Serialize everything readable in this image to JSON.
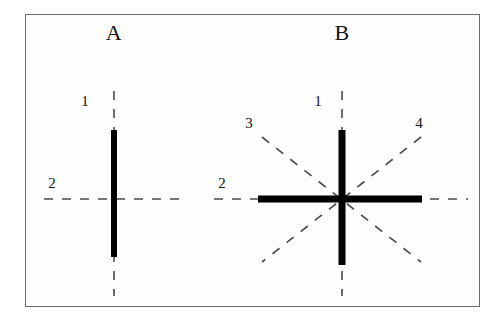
{
  "figure": {
    "background_color": "#fdfdfd",
    "border_color": "#6b6b6b",
    "stroke_color": "#000000",
    "dash_color": "#4a4a4a"
  },
  "panels": [
    {
      "title": "A",
      "title_x": 114,
      "title_y": 33,
      "center_x": 114,
      "center_y": 199,
      "labels": [
        {
          "text": "1",
          "x": 85,
          "y": 101
        },
        {
          "text": "2",
          "x": 52,
          "y": 183
        }
      ],
      "solid_bars": [
        {
          "name": "vertical-bar",
          "x1": 114,
          "y1": 130,
          "x2": 114,
          "y2": 257,
          "width": 6
        }
      ],
      "dashed_axes": [
        {
          "name": "axis-1-vertical",
          "x1": 114,
          "y1": 91,
          "x2": 114,
          "y2": 296
        },
        {
          "name": "axis-2-horizontal",
          "x1": 44,
          "y1": 199,
          "x2": 180,
          "y2": 199
        }
      ]
    },
    {
      "title": "B",
      "title_x": 342,
      "title_y": 33,
      "center_x": 342,
      "center_y": 199,
      "labels": [
        {
          "text": "1",
          "x": 318,
          "y": 101
        },
        {
          "text": "2",
          "x": 222,
          "y": 183
        },
        {
          "text": "3",
          "x": 249,
          "y": 123
        },
        {
          "text": "4",
          "x": 419,
          "y": 123
        }
      ],
      "solid_bars": [
        {
          "name": "vertical-bar",
          "x1": 342,
          "y1": 130,
          "x2": 342,
          "y2": 265,
          "width": 7
        },
        {
          "name": "horizontal-bar",
          "x1": 258,
          "y1": 199,
          "x2": 422,
          "y2": 199,
          "width": 7
        }
      ],
      "dashed_axes": [
        {
          "name": "axis-1-vertical",
          "x1": 342,
          "y1": 91,
          "x2": 342,
          "y2": 296
        },
        {
          "name": "axis-2-horizontal",
          "x1": 214,
          "y1": 199,
          "x2": 468,
          "y2": 199
        },
        {
          "name": "axis-3-diagonal",
          "x1": 262,
          "y1": 137,
          "x2": 421,
          "y2": 262
        },
        {
          "name": "axis-4-diagonal",
          "x1": 421,
          "y1": 137,
          "x2": 262,
          "y2": 262
        }
      ]
    }
  ]
}
